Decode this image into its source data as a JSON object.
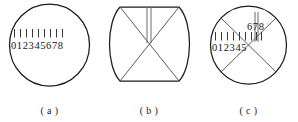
{
  "figure": {
    "panels": [
      {
        "id": "panel-a",
        "caption": "( a )",
        "shape": "circle",
        "scale_main": "012345678",
        "scale_offset": "",
        "tick_count": 9,
        "has_cross": false,
        "has_vertical_pair": false
      },
      {
        "id": "panel-b",
        "caption": "( b )",
        "shape": "barrel",
        "scale_main": "",
        "scale_offset": "",
        "tick_count": 0,
        "has_cross": true,
        "has_vertical_pair": true
      },
      {
        "id": "panel-c",
        "caption": "( c )",
        "shape": "circle",
        "scale_main": "012345",
        "scale_offset": "678",
        "tick_count": 9,
        "has_cross": true,
        "has_vertical_pair": true
      }
    ],
    "colors": {
      "outline": "#1c1c1c",
      "cross_line": "#4a4a4a",
      "tick": "#242424",
      "vertical_bar": "#6b6b6b",
      "text": "#141414",
      "background": "#ffffff"
    }
  }
}
